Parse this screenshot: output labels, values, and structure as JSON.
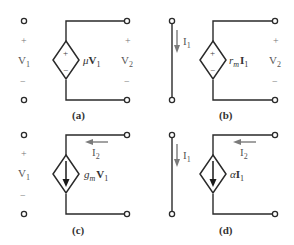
{
  "figure": {
    "panels": [
      {
        "id": "a",
        "caption": "(a)",
        "input_port": {
          "type": "open",
          "voltage_label": "V",
          "voltage_sub": "1",
          "plus": "+",
          "minus": "−"
        },
        "source": {
          "type": "voltage-controlled voltage source",
          "symbol": "dependent-voltage-source",
          "plus": "+",
          "minus": "−",
          "gain": "μ",
          "control": "V",
          "control_sub": "1"
        },
        "output_port": {
          "voltage_label": "V",
          "voltage_sub": "2",
          "plus": "+",
          "minus": "−"
        }
      },
      {
        "id": "b",
        "caption": "(b)",
        "input_port": {
          "type": "short",
          "current_label": "I",
          "current_sub": "1"
        },
        "source": {
          "type": "current-controlled voltage source",
          "symbol": "dependent-voltage-source",
          "plus": "+",
          "minus": "−",
          "gain": "r",
          "gain_sub": "m",
          "control": "I",
          "control_sub": "1"
        },
        "output_port": {
          "voltage_label": "V",
          "voltage_sub": "2",
          "plus": "+",
          "minus": "−"
        }
      },
      {
        "id": "c",
        "caption": "(c)",
        "input_port": {
          "type": "open",
          "voltage_label": "V",
          "voltage_sub": "1",
          "plus": "+",
          "minus": "−"
        },
        "source": {
          "type": "voltage-controlled current source",
          "symbol": "dependent-current-source",
          "gain": "g",
          "gain_sub": "m",
          "control": "V",
          "control_sub": "1"
        },
        "output_port": {
          "current_label": "I",
          "current_sub": "2"
        }
      },
      {
        "id": "d",
        "caption": "(d)",
        "input_port": {
          "type": "short",
          "current_label": "I",
          "current_sub": "1"
        },
        "source": {
          "type": "current-controlled current source",
          "symbol": "dependent-current-source",
          "gain": "α",
          "control": "I",
          "control_sub": "1"
        },
        "output_port": {
          "current_label": "I",
          "current_sub": "2"
        }
      }
    ]
  }
}
